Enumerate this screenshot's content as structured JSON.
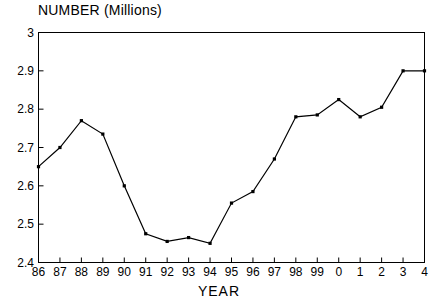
{
  "chart_data": {
    "type": "line",
    "title": "NUMBER (Millions)",
    "xlabel": "YEAR",
    "ylabel": "",
    "categories": [
      "86",
      "87",
      "88",
      "89",
      "90",
      "91",
      "92",
      "93",
      "94",
      "95",
      "96",
      "97",
      "98",
      "99",
      "0",
      "1",
      "2",
      "3",
      "4"
    ],
    "values": [
      2.65,
      2.7,
      2.77,
      2.735,
      2.6,
      2.475,
      2.455,
      2.465,
      2.45,
      2.555,
      2.585,
      2.67,
      2.78,
      2.785,
      2.825,
      2.78,
      2.805,
      2.9,
      2.9
    ],
    "ylim": [
      2.4,
      3.0
    ],
    "yticks": [
      "2.4",
      "2.5",
      "2.6",
      "2.7",
      "2.8",
      "2.9",
      "3"
    ],
    "ytick_values": [
      2.4,
      2.5,
      2.6,
      2.7,
      2.8,
      2.9,
      3.0
    ],
    "xticks": [
      "86",
      "87",
      "88",
      "89",
      "90",
      "91",
      "92",
      "93",
      "94",
      "95",
      "96",
      "97",
      "98",
      "99",
      "0",
      "1",
      "2",
      "3",
      "4"
    ],
    "grid": false,
    "legend": null,
    "line_color": "#000000",
    "marker": "square",
    "axis_color": "#000000"
  }
}
